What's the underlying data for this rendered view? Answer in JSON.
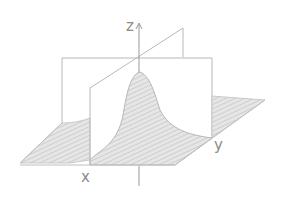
{
  "diagram": {
    "type": "3d-surface-sketch",
    "labels": {
      "x_axis": "x",
      "y_axis": "y",
      "z_axis": "z"
    },
    "colors": {
      "line": "#b5b5b5",
      "axis": "#9a9a9a",
      "hatch": "#c8c8c8",
      "surface_fill": "#e2e2e2",
      "text": "#8a8a8a",
      "background": "#ffffff"
    }
  }
}
